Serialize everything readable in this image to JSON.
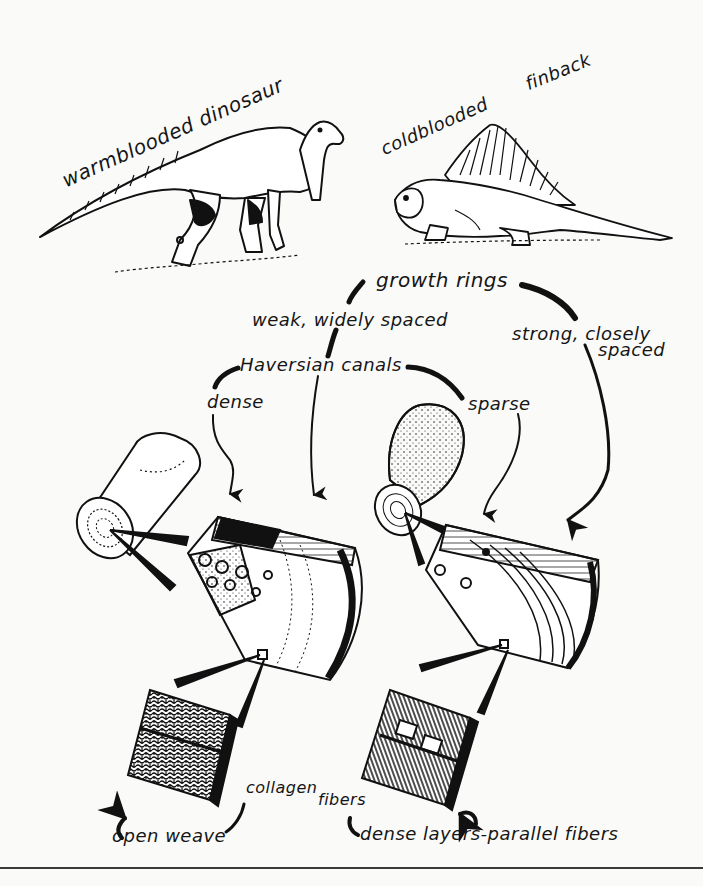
{
  "diagram": {
    "animals": {
      "warm": {
        "label": "warmblooded dinosaur",
        "icon": "hadrosaur-illustration"
      },
      "cold": {
        "label_1": "coldblooded",
        "label_2": "finback",
        "icon": "dimetrodon-illustration"
      }
    },
    "growth_rings": {
      "label": "growth rings",
      "warm_branch": "weak, widely spaced",
      "cold_branch_1": "strong, closely",
      "cold_branch_2": "spaced"
    },
    "haversian_canals": {
      "label": "Haversian canals",
      "warm_branch": "dense",
      "cold_branch": "sparse"
    },
    "collagen_fibers": {
      "label_1": "collagen",
      "label_2": "fibers",
      "warm_branch": "open weave",
      "cold_branch": "dense layers-parallel fibers"
    },
    "colors": {
      "ink": "#111111",
      "paper": "#fafaf9"
    }
  }
}
